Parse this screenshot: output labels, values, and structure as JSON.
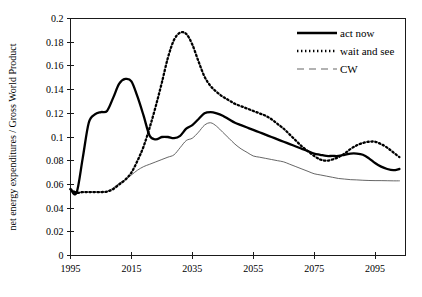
{
  "chart_data": {
    "type": "line",
    "title": "",
    "xlabel": "",
    "ylabel": "net energy expenditures / Gross World Product",
    "xlim": [
      1995,
      2105
    ],
    "ylim": [
      0,
      0.2
    ],
    "grid": false,
    "legend_position": "top-right",
    "xticks": [
      1995,
      2015,
      2035,
      2055,
      2075,
      2095
    ],
    "xtick_labels": [
      "1995",
      "2015",
      "2035",
      "2055",
      "2075",
      "2095"
    ],
    "yticks": [
      0,
      0.02,
      0.04,
      0.06,
      0.08,
      0.1,
      0.12,
      0.14,
      0.16,
      0.18,
      0.2
    ],
    "ytick_labels": [
      "0",
      "0.02",
      "0.04",
      "0.06",
      "0.08",
      "0.1",
      "0.12",
      "0.14",
      "0.16",
      "0.18",
      "0.2"
    ],
    "x": [
      1995,
      1997,
      1999,
      2001,
      2003,
      2005,
      2007,
      2009,
      2011,
      2013,
      2015,
      2017,
      2019,
      2021,
      2023,
      2025,
      2027,
      2029,
      2031,
      2033,
      2035,
      2037,
      2039,
      2041,
      2043,
      2045,
      2047,
      2049,
      2051,
      2053,
      2055,
      2057,
      2059,
      2061,
      2063,
      2065,
      2067,
      2069,
      2071,
      2073,
      2075,
      2077,
      2079,
      2081,
      2083,
      2085,
      2087,
      2089,
      2091,
      2093,
      2095,
      2097,
      2099,
      2101,
      2103
    ],
    "series": [
      {
        "name": "act now",
        "style": "solid-thick",
        "color": "#000000",
        "values": [
          0.056,
          0.053,
          0.082,
          0.112,
          0.119,
          0.121,
          0.122,
          0.133,
          0.145,
          0.149,
          0.147,
          0.134,
          0.118,
          0.101,
          0.098,
          0.1,
          0.1,
          0.099,
          0.101,
          0.107,
          0.11,
          0.115,
          0.12,
          0.121,
          0.12,
          0.118,
          0.115,
          0.112,
          0.11,
          0.108,
          0.106,
          0.104,
          0.102,
          0.1,
          0.098,
          0.096,
          0.094,
          0.092,
          0.09,
          0.088,
          0.086,
          0.085,
          0.084,
          0.084,
          0.084,
          0.085,
          0.086,
          0.086,
          0.085,
          0.082,
          0.078,
          0.075,
          0.073,
          0.072,
          0.073
        ]
      },
      {
        "name": "wait and see",
        "style": "dotted-thick",
        "color": "#000000",
        "values": [
          0.056,
          0.053,
          0.0535,
          0.0535,
          0.0535,
          0.0535,
          0.054,
          0.056,
          0.06,
          0.064,
          0.07,
          0.08,
          0.092,
          0.108,
          0.126,
          0.146,
          0.167,
          0.182,
          0.188,
          0.187,
          0.178,
          0.164,
          0.151,
          0.143,
          0.138,
          0.134,
          0.131,
          0.128,
          0.126,
          0.124,
          0.122,
          0.12,
          0.118,
          0.115,
          0.111,
          0.107,
          0.102,
          0.097,
          0.092,
          0.088,
          0.084,
          0.081,
          0.08,
          0.081,
          0.083,
          0.086,
          0.09,
          0.093,
          0.095,
          0.096,
          0.096,
          0.094,
          0.091,
          0.087,
          0.083
        ]
      },
      {
        "name": "CW",
        "style": "thin",
        "color": "#4a4a4a",
        "values": [
          0.056,
          0.053,
          0.0535,
          0.0535,
          0.0535,
          0.0535,
          0.054,
          0.057,
          0.061,
          0.064,
          0.068,
          0.072,
          0.075,
          0.077,
          0.079,
          0.081,
          0.083,
          0.085,
          0.091,
          0.097,
          0.099,
          0.104,
          0.11,
          0.112,
          0.109,
          0.104,
          0.099,
          0.094,
          0.09,
          0.087,
          0.084,
          0.083,
          0.082,
          0.081,
          0.08,
          0.079,
          0.077,
          0.075,
          0.073,
          0.071,
          0.069,
          0.068,
          0.067,
          0.066,
          0.065,
          0.0645,
          0.064,
          0.0638,
          0.0635,
          0.0633,
          0.0632,
          0.0632,
          0.0631,
          0.063,
          0.063
        ]
      }
    ],
    "legend": [
      {
        "label": "act now",
        "style": "solid-thick",
        "color": "#000000"
      },
      {
        "label": "wait and see",
        "style": "dotted-thick",
        "color": "#000000"
      },
      {
        "label": "CW",
        "style": "thin-dashed",
        "color": "#4a4a4a"
      }
    ]
  }
}
